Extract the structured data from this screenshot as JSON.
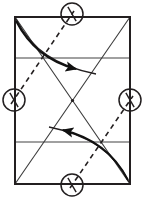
{
  "figure": {
    "type": "geometric-fold-diagram",
    "canvas": {
      "width": 144,
      "height": 200,
      "background": "#ffffff"
    },
    "colors": {
      "outline": "#231f20",
      "crease_gray": "#808080",
      "diagonal": "#3a3a3a",
      "dashed": "#231f20",
      "arrow": "#111111",
      "circle": "#231f20",
      "background": "#ffffff"
    },
    "paper_rect": {
      "name": "paper-boundary",
      "left": 15,
      "top": 17,
      "right": 130,
      "bottom": 184,
      "width": 115,
      "height": 167,
      "stroke_width": 2.0
    },
    "horizontal_creases": [
      {
        "name": "upper-quarter-crease",
        "y": 58,
        "x1": 15,
        "x2": 130
      },
      {
        "name": "lower-quarter-crease",
        "y": 142,
        "x1": 15,
        "x2": 130
      }
    ],
    "center_point": {
      "x": 72.5,
      "y": 100.5
    },
    "diagonals": [
      {
        "name": "diagonal-tl-br",
        "x1": 15,
        "y1": 17,
        "x2": 130,
        "y2": 184
      },
      {
        "name": "diagonal-bl-tr",
        "x1": 15,
        "y1": 184,
        "x2": 130,
        "y2": 17
      }
    ],
    "dashed_line": {
      "name": "dashed-fold-axis",
      "x1": 14,
      "y1": 100,
      "x2": 72,
      "y2": 14,
      "x3": 72.5,
      "y3": 100.5,
      "x4": 130,
      "y4": 186,
      "dash_pattern": "5,4",
      "stroke_width": 1.6
    },
    "markers": [
      {
        "name": "marker-top",
        "cx": 72,
        "cy": 14,
        "r": 11,
        "tick_angle_deg": 300
      },
      {
        "name": "marker-left",
        "cx": 14,
        "cy": 100,
        "r": 11,
        "tick_angle_deg": 300
      },
      {
        "name": "marker-right",
        "cx": 130,
        "cy": 100,
        "r": 11,
        "tick_angle_deg": 300
      },
      {
        "name": "marker-bottom",
        "cx": 72,
        "cy": 185,
        "r": 11,
        "tick_angle_deg": 300
      }
    ],
    "arrows": [
      {
        "name": "fold-arrow-upper-right",
        "direction": "right",
        "path": "M 16,21 C 30,48 52,63 78,69",
        "head_x": 82,
        "head_y": 70,
        "head_rotation_deg": 14
      },
      {
        "name": "fold-arrow-lower-left",
        "direction": "left",
        "path": "M 128,180 C 114,153 92,137 61,130",
        "head_x": 57,
        "head_y": 129,
        "head_rotation_deg": 194
      }
    ],
    "secondary_curves": [
      {
        "name": "fold-edge-curve-upper",
        "path": "M 16,19 C 32,50 56,66 96,74"
      },
      {
        "name": "fold-edge-curve-lower",
        "path": "M 129,182 C 113,151 89,135 49,127"
      }
    ]
  }
}
